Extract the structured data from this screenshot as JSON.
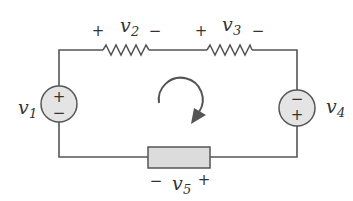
{
  "diagram": {
    "type": "circuit",
    "colors": {
      "wire": "#555555",
      "source_fill": "#e4e4e4",
      "element_fill": "#dcdcdc",
      "text": "#333333"
    },
    "elements": {
      "v1": {
        "label_base": "v",
        "label_sub": "1",
        "type": "voltage-source",
        "top_sign": "+",
        "bottom_sign": "−"
      },
      "v2": {
        "label_base": "v",
        "label_sub": "2",
        "type": "resistor",
        "left_sign": "+",
        "right_sign": "−"
      },
      "v3": {
        "label_base": "v",
        "label_sub": "3",
        "type": "resistor",
        "left_sign": "+",
        "right_sign": "−"
      },
      "v4": {
        "label_base": "v",
        "label_sub": "4",
        "type": "voltage-source",
        "top_sign": "−",
        "bottom_sign": "+"
      },
      "v5": {
        "label_base": "v",
        "label_sub": "5",
        "type": "generic-element",
        "left_sign": "−",
        "right_sign": "+"
      }
    },
    "loop_direction": "clockwise"
  }
}
